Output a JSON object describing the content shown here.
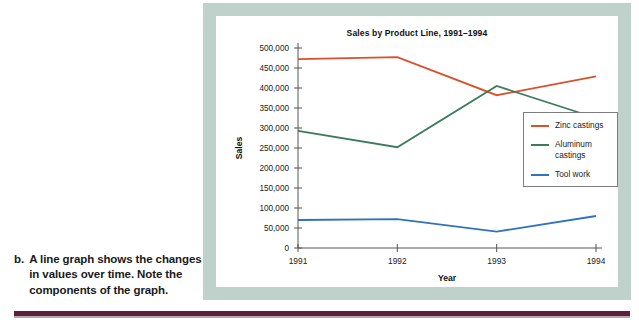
{
  "caption": {
    "marker": "b.",
    "text": "A line graph shows the changes in values over time. Note the components of the graph."
  },
  "figure": {
    "frame_color": "#bed1ca",
    "rule_color": "#5c1f3d"
  },
  "chart_data": {
    "type": "line",
    "title": "Sales by Product Line, 1991–1994",
    "xlabel": "Year",
    "ylabel": "Sales",
    "categories": [
      "1991",
      "1992",
      "1993",
      "1994"
    ],
    "ylim": [
      0,
      500000
    ],
    "ytick_step": 50000,
    "ytick_labels": [
      "0",
      "50,000",
      "100,000",
      "150,000",
      "200,000",
      "250,000",
      "300,000",
      "350,000",
      "400,000",
      "450,000",
      "500,000"
    ],
    "ytick_values": [
      0,
      50000,
      100000,
      150000,
      200000,
      250000,
      300000,
      350000,
      400000,
      450000,
      500000
    ],
    "grid": false,
    "legend_position": "right",
    "series": [
      {
        "name": "Zinc castings",
        "color": "#d9512c",
        "values": [
          472000,
          477000,
          382000,
          429000
        ]
      },
      {
        "name": "Aluminum castings",
        "color": "#3c7a5e",
        "values": [
          293000,
          252000,
          405000,
          325000
        ]
      },
      {
        "name": "Tool work",
        "color": "#2f72bd",
        "values": [
          70000,
          72000,
          41000,
          80000
        ]
      }
    ]
  }
}
